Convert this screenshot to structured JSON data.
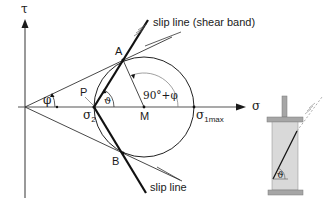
{
  "diagram": {
    "type": "mohr-coulomb-circle",
    "axes": {
      "vertical_label": "τ",
      "horizontal_label": "σ"
    },
    "points": {
      "A": "A",
      "B": "B",
      "P": "P",
      "M": "M"
    },
    "axis_labels": {
      "sigma2_main": "σ",
      "sigma2_sub": "2",
      "sigma1_main": "σ",
      "sigma1_sub": "1max"
    },
    "angles": {
      "phi": "φ",
      "theta": "ϑ",
      "ninety_plus_phi": "90°+φ"
    },
    "annotations": {
      "upper_slip_line": "slip line (shear band)",
      "lower_slip_line": "slip line"
    },
    "specimen": {
      "angle_label": "ϑ"
    },
    "colors": {
      "line": "#1a1a1a",
      "thin_line": "#333333",
      "specimen_fill": "#d9d9d9",
      "specimen_plate": "#a6a6a6",
      "specimen_stroke": "#7a7a7a"
    }
  }
}
